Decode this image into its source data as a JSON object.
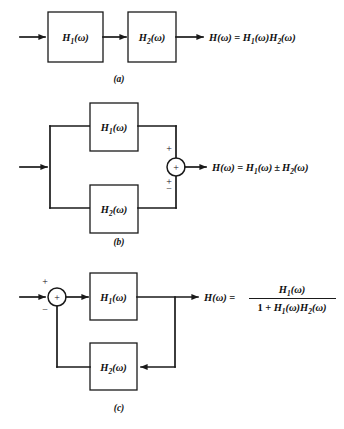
{
  "figure": {
    "background_color": "#ffffff",
    "line_color": "#1a1a1a",
    "variable": "ω"
  },
  "diagrams": [
    {
      "id": "a",
      "caption": "(a)",
      "configuration": "cascade",
      "blocks": [
        {
          "name": "block-h1",
          "label_main": "H",
          "label_sub": "1",
          "label_arg": "(ω)"
        },
        {
          "name": "block-h2",
          "label_main": "H",
          "label_sub": "2",
          "label_arg": "(ω)"
        }
      ],
      "equation": {
        "lhs_main": "H",
        "lhs_arg": "(ω)",
        "equals": "=",
        "rhs_parts": [
          {
            "main": "H",
            "sub": "1",
            "arg": "(ω)"
          },
          {
            "main": "H",
            "sub": "2",
            "arg": "(ω)"
          }
        ],
        "plain": "H(ω) = H1(ω)H2(ω)"
      }
    },
    {
      "id": "b",
      "caption": "(b)",
      "configuration": "parallel",
      "blocks": [
        {
          "name": "block-h1",
          "label_main": "H",
          "label_sub": "1",
          "label_arg": "(ω)"
        },
        {
          "name": "block-h2",
          "label_main": "H",
          "label_sub": "2",
          "label_arg": "(ω)"
        }
      ],
      "summing_junction": {
        "inner_sign": "+",
        "top_input_sign": "+",
        "bottom_input_sign_primary": "+",
        "bottom_input_sign_secondary": "−"
      },
      "equation": {
        "lhs_main": "H",
        "lhs_arg": "(ω)",
        "equals": "=",
        "operator": "±",
        "rhs_parts": [
          {
            "main": "H",
            "sub": "1",
            "arg": "(ω)"
          },
          {
            "main": "H",
            "sub": "2",
            "arg": "(ω)"
          }
        ],
        "plain": "H(ω) = H1(ω) ± H2(ω)"
      }
    },
    {
      "id": "c",
      "caption": "(c)",
      "configuration": "feedback",
      "blocks": [
        {
          "name": "block-h1",
          "label_main": "H",
          "label_sub": "1",
          "label_arg": "(ω)"
        },
        {
          "name": "block-h2",
          "label_main": "H",
          "label_sub": "2",
          "label_arg": "(ω)"
        }
      ],
      "summing_junction": {
        "inner_sign": "+",
        "top_input_sign": "+",
        "bottom_input_sign": "−"
      },
      "equation": {
        "lhs_main": "H",
        "lhs_arg": "(ω)",
        "equals": "=",
        "numerator": {
          "main": "H",
          "sub": "1",
          "arg": "(ω)"
        },
        "denominator": {
          "one": "1",
          "plus": "+",
          "parts": [
            {
              "main": "H",
              "sub": "1",
              "arg": "(ω)"
            },
            {
              "main": "H",
              "sub": "2",
              "arg": "(ω)"
            }
          ]
        },
        "plain": "H(ω) = H1(ω) / (1 + H1(ω)H2(ω))"
      }
    }
  ]
}
